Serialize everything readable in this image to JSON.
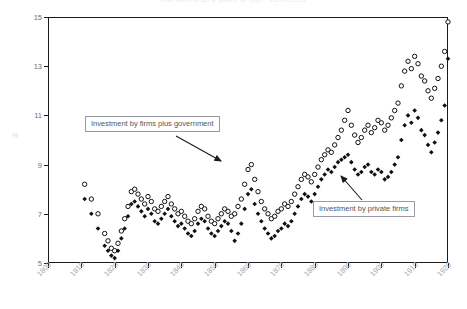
{
  "chart_data": {
    "type": "scatter",
    "title": "Investment as a share of GDP, 1800-1920",
    "xlabel": "",
    "ylabel": "%",
    "xlim": [
      1800,
      1920
    ],
    "ylim": [
      5,
      15
    ],
    "grid": false,
    "legend_position": "annotations",
    "xticks": [
      "1800",
      "1810",
      "1820",
      "1830",
      "1840",
      "1850",
      "1860",
      "1870",
      "1880",
      "1890",
      "1900",
      "1910",
      "1920"
    ],
    "yticks": [
      "5",
      "7",
      "9",
      "11",
      "13",
      "15"
    ],
    "annotations": [
      {
        "text": "Investment by firms plus government",
        "target_x": 1856,
        "target_y": 9.0
      },
      {
        "text": "Investment by private firms",
        "target_x": 1898,
        "target_y": 8.6
      }
    ],
    "series": [
      {
        "name": "Investment by firms plus government",
        "marker": "open-circle",
        "color": "#111111",
        "points": [
          [
            1811,
            8.2
          ],
          [
            1813,
            7.6
          ],
          [
            1815,
            7.0
          ],
          [
            1817,
            6.2
          ],
          [
            1818,
            5.9
          ],
          [
            1819,
            5.6
          ],
          [
            1820,
            5.5
          ],
          [
            1821,
            5.8
          ],
          [
            1822,
            6.3
          ],
          [
            1823,
            6.8
          ],
          [
            1824,
            7.3
          ],
          [
            1825,
            7.9
          ],
          [
            1826,
            8.0
          ],
          [
            1827,
            7.8
          ],
          [
            1828,
            7.6
          ],
          [
            1829,
            7.4
          ],
          [
            1830,
            7.7
          ],
          [
            1831,
            7.5
          ],
          [
            1832,
            7.2
          ],
          [
            1833,
            7.1
          ],
          [
            1834,
            7.3
          ],
          [
            1835,
            7.5
          ],
          [
            1836,
            7.7
          ],
          [
            1837,
            7.4
          ],
          [
            1838,
            7.2
          ],
          [
            1839,
            7.0
          ],
          [
            1840,
            7.1
          ],
          [
            1841,
            6.9
          ],
          [
            1842,
            6.7
          ],
          [
            1843,
            6.6
          ],
          [
            1844,
            6.8
          ],
          [
            1845,
            7.1
          ],
          [
            1846,
            7.3
          ],
          [
            1847,
            7.2
          ],
          [
            1848,
            6.9
          ],
          [
            1849,
            6.7
          ],
          [
            1850,
            6.6
          ],
          [
            1851,
            6.8
          ],
          [
            1852,
            7.0
          ],
          [
            1853,
            7.2
          ],
          [
            1854,
            7.1
          ],
          [
            1855,
            6.9
          ],
          [
            1856,
            7.0
          ],
          [
            1857,
            7.3
          ],
          [
            1858,
            7.6
          ],
          [
            1859,
            8.2
          ],
          [
            1860,
            8.8
          ],
          [
            1861,
            9.0
          ],
          [
            1862,
            8.4
          ],
          [
            1863,
            7.9
          ],
          [
            1864,
            7.5
          ],
          [
            1865,
            7.2
          ],
          [
            1866,
            7.0
          ],
          [
            1867,
            6.8
          ],
          [
            1868,
            6.9
          ],
          [
            1869,
            7.1
          ],
          [
            1870,
            7.2
          ],
          [
            1871,
            7.4
          ],
          [
            1872,
            7.3
          ],
          [
            1873,
            7.5
          ],
          [
            1874,
            7.8
          ],
          [
            1875,
            8.1
          ],
          [
            1876,
            8.4
          ],
          [
            1877,
            8.6
          ],
          [
            1878,
            8.5
          ],
          [
            1879,
            8.3
          ],
          [
            1880,
            8.6
          ],
          [
            1881,
            8.9
          ],
          [
            1882,
            9.2
          ],
          [
            1883,
            9.4
          ],
          [
            1884,
            9.6
          ],
          [
            1885,
            9.5
          ],
          [
            1886,
            9.8
          ],
          [
            1887,
            10.1
          ],
          [
            1888,
            10.4
          ],
          [
            1889,
            10.8
          ],
          [
            1890,
            11.2
          ],
          [
            1891,
            10.6
          ],
          [
            1892,
            10.2
          ],
          [
            1893,
            9.9
          ],
          [
            1894,
            10.1
          ],
          [
            1895,
            10.4
          ],
          [
            1896,
            10.6
          ],
          [
            1897,
            10.3
          ],
          [
            1898,
            10.5
          ],
          [
            1899,
            10.8
          ],
          [
            1900,
            10.7
          ],
          [
            1901,
            10.4
          ],
          [
            1902,
            10.6
          ],
          [
            1903,
            10.9
          ],
          [
            1904,
            11.2
          ],
          [
            1905,
            11.5
          ],
          [
            1906,
            12.2
          ],
          [
            1907,
            12.8
          ],
          [
            1908,
            13.2
          ],
          [
            1909,
            12.9
          ],
          [
            1910,
            13.4
          ],
          [
            1911,
            13.1
          ],
          [
            1912,
            12.6
          ],
          [
            1913,
            12.4
          ],
          [
            1914,
            12.0
          ],
          [
            1915,
            11.7
          ],
          [
            1916,
            12.1
          ],
          [
            1917,
            12.5
          ],
          [
            1918,
            13.0
          ],
          [
            1919,
            13.6
          ],
          [
            1920,
            14.8
          ]
        ]
      },
      {
        "name": "Investment by private firms",
        "marker": "filled-diamond",
        "color": "#111111",
        "points": [
          [
            1811,
            7.6
          ],
          [
            1813,
            7.0
          ],
          [
            1815,
            6.4
          ],
          [
            1817,
            5.7
          ],
          [
            1818,
            5.5
          ],
          [
            1819,
            5.3
          ],
          [
            1820,
            5.2
          ],
          [
            1821,
            5.5
          ],
          [
            1822,
            6.0
          ],
          [
            1823,
            6.4
          ],
          [
            1824,
            6.9
          ],
          [
            1825,
            7.4
          ],
          [
            1826,
            7.5
          ],
          [
            1827,
            7.3
          ],
          [
            1828,
            7.1
          ],
          [
            1829,
            6.9
          ],
          [
            1830,
            7.2
          ],
          [
            1831,
            7.0
          ],
          [
            1832,
            6.7
          ],
          [
            1833,
            6.6
          ],
          [
            1834,
            6.8
          ],
          [
            1835,
            7.0
          ],
          [
            1836,
            7.2
          ],
          [
            1837,
            6.9
          ],
          [
            1838,
            6.7
          ],
          [
            1839,
            6.5
          ],
          [
            1840,
            6.6
          ],
          [
            1841,
            6.4
          ],
          [
            1842,
            6.2
          ],
          [
            1843,
            6.1
          ],
          [
            1844,
            6.3
          ],
          [
            1845,
            6.6
          ],
          [
            1846,
            6.8
          ],
          [
            1847,
            6.7
          ],
          [
            1848,
            6.4
          ],
          [
            1849,
            6.2
          ],
          [
            1850,
            6.1
          ],
          [
            1851,
            6.3
          ],
          [
            1852,
            6.5
          ],
          [
            1853,
            6.7
          ],
          [
            1854,
            6.6
          ],
          [
            1855,
            6.3
          ],
          [
            1856,
            5.9
          ],
          [
            1857,
            6.2
          ],
          [
            1858,
            6.6
          ],
          [
            1859,
            7.2
          ],
          [
            1860,
            7.8
          ],
          [
            1861,
            8.0
          ],
          [
            1862,
            7.4
          ],
          [
            1863,
            7.0
          ],
          [
            1864,
            6.7
          ],
          [
            1865,
            6.4
          ],
          [
            1866,
            6.2
          ],
          [
            1867,
            6.0
          ],
          [
            1868,
            6.1
          ],
          [
            1869,
            6.3
          ],
          [
            1870,
            6.4
          ],
          [
            1871,
            6.6
          ],
          [
            1872,
            6.5
          ],
          [
            1873,
            6.7
          ],
          [
            1874,
            7.0
          ],
          [
            1875,
            7.3
          ],
          [
            1876,
            7.6
          ],
          [
            1877,
            7.8
          ],
          [
            1878,
            7.7
          ],
          [
            1879,
            7.5
          ],
          [
            1880,
            7.8
          ],
          [
            1881,
            8.1
          ],
          [
            1882,
            8.4
          ],
          [
            1883,
            8.6
          ],
          [
            1884,
            8.8
          ],
          [
            1885,
            8.7
          ],
          [
            1886,
            8.9
          ],
          [
            1887,
            9.1
          ],
          [
            1888,
            9.2
          ],
          [
            1889,
            9.3
          ],
          [
            1890,
            9.4
          ],
          [
            1891,
            9.1
          ],
          [
            1892,
            8.8
          ],
          [
            1893,
            8.6
          ],
          [
            1894,
            8.7
          ],
          [
            1895,
            8.9
          ],
          [
            1896,
            9.0
          ],
          [
            1897,
            8.7
          ],
          [
            1898,
            8.6
          ],
          [
            1899,
            8.8
          ],
          [
            1900,
            8.7
          ],
          [
            1901,
            8.4
          ],
          [
            1902,
            8.5
          ],
          [
            1903,
            8.7
          ],
          [
            1904,
            9.0
          ],
          [
            1905,
            9.3
          ],
          [
            1906,
            10.0
          ],
          [
            1907,
            10.6
          ],
          [
            1908,
            11.0
          ],
          [
            1909,
            10.7
          ],
          [
            1910,
            11.2
          ],
          [
            1911,
            10.9
          ],
          [
            1912,
            10.4
          ],
          [
            1913,
            10.2
          ],
          [
            1914,
            9.8
          ],
          [
            1915,
            9.5
          ],
          [
            1916,
            9.9
          ],
          [
            1917,
            10.3
          ],
          [
            1918,
            10.8
          ],
          [
            1919,
            11.4
          ],
          [
            1920,
            13.3
          ]
        ]
      }
    ]
  }
}
